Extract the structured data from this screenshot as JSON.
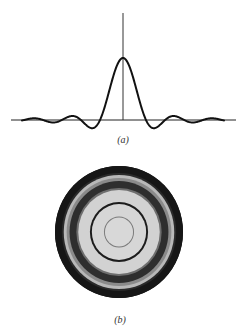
{
  "figure": {
    "panels": [
      {
        "id": "a",
        "caption": "(a)",
        "description": "Airy amplitude pattern 2J1(x)/x with central peak and decaying side lobes",
        "axes": {
          "horizontal": {
            "x1": 11,
            "x2": 236,
            "y": 120
          },
          "vertical": {
            "x": 123,
            "y1": 13,
            "y2": 120
          }
        },
        "curve": {
          "function": "2*J1(x)/x",
          "center_x": 123,
          "baseline_y": 120,
          "peak_height_px": 62,
          "first_zero_px": 23,
          "first_zero_arg": 3.8317,
          "x_extent_px": 101,
          "stroke": "#111111",
          "stroke_width": 2
        }
      },
      {
        "id": "b",
        "caption": "(b)",
        "description": "Circular diffraction pattern (Airy disc) with concentric rings",
        "disc": {
          "cx": 119,
          "cy": 232,
          "rx": 64,
          "ry": 66,
          "outer_color": "#141414",
          "rings": [
            {
              "r": 66,
              "color": "#161616"
            },
            {
              "r": 59,
              "color": "#2a2a2a"
            },
            {
              "r": 57,
              "color": "#b8b8b8"
            },
            {
              "r": 54,
              "color": "#8a8a8a"
            },
            {
              "r": 51,
              "color": "#2e2e2e"
            },
            {
              "r": 44,
              "color": "#6e6e6e"
            },
            {
              "r": 42,
              "color": "#d2d2d2"
            },
            {
              "r": 30,
              "color": "#1c1c1c"
            },
            {
              "r": 28,
              "color": "#d6d6d6"
            },
            {
              "r": 15.5,
              "color": "#7a7a7a"
            },
            {
              "r": 14.5,
              "color": "#d8d8d8"
            }
          ]
        }
      }
    ]
  }
}
